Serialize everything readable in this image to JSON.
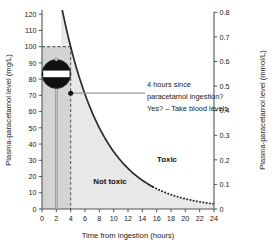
{
  "chart_data": {
    "type": "line",
    "title": "",
    "xlabel": "Time from ingestion (hours)",
    "ylabel": "Plasma-paracetamol level (mg/L)",
    "y2label": "Plasma-paracetamol level (mmol/L)",
    "xlim": [
      0,
      24
    ],
    "ylim": [
      0,
      120
    ],
    "y2lim": [
      0,
      0.8
    ],
    "grid": false,
    "legend": "none",
    "xticks": [
      0,
      2,
      4,
      6,
      8,
      10,
      12,
      14,
      16,
      18,
      20,
      22,
      24
    ],
    "yticks": [
      0,
      10,
      20,
      30,
      40,
      50,
      60,
      70,
      80,
      90,
      100,
      110,
      120
    ],
    "y2ticks": [
      "0",
      "0.1",
      "0.2",
      "0.3",
      "0.4",
      "0.5",
      "0.6",
      "0.7",
      "0.8"
    ],
    "series": [
      {
        "name": "treatment-line",
        "style": "solid-then-dotted",
        "solid_to_x": 15.5,
        "x": [
          1.5,
          2,
          3,
          4,
          5,
          6,
          7,
          8,
          9,
          10,
          11,
          12,
          13,
          14,
          15,
          16,
          17,
          18,
          19,
          20,
          21,
          22,
          23,
          24
        ],
        "y": [
          200,
          170,
          128,
          100,
          80,
          65,
          53,
          43,
          35,
          29,
          24,
          20,
          16.5,
          13.8,
          11.5,
          9.6,
          8.0,
          6.7,
          5.6,
          4.7,
          3.9,
          3.3,
          2.8,
          2.4
        ]
      }
    ],
    "markers": [
      {
        "name": "four-hour-point",
        "x": 4,
        "y": 70,
        "shape": "filled-circle"
      }
    ],
    "reference_lines": [
      {
        "name": "hundred-mg-per-l-dashed",
        "orientation": "horizontal",
        "y": 100,
        "x_from": 0,
        "x_to": 4,
        "style": "dashed"
      },
      {
        "name": "four-hours-dashed",
        "orientation": "vertical",
        "x": 4,
        "y_from": 0,
        "y_to": 100,
        "style": "dashed"
      }
    ],
    "zones": [
      {
        "name": "toxic",
        "label": "Toxic",
        "x": 13.2,
        "y": 46
      },
      {
        "name": "not-toxic",
        "label": "Not toxic",
        "x": 7.4,
        "y": 20
      }
    ],
    "shaded_regions": [
      {
        "name": "pre-four-hour-band",
        "description": "darker grey band from 0 to 4 hours up to 100 mg/L",
        "color": "#d4d4d4"
      },
      {
        "name": "under-curve-band",
        "description": "light grey fill under the treatment line",
        "color": "#e8e8e8"
      }
    ]
  },
  "annotation": {
    "name": "four-hour-annotation",
    "lines": [
      "4 hours since",
      "paracetamol ingestion?",
      "Yes? – Take blood levels"
    ]
  },
  "icon": {
    "name": "no-entry-sign-icon",
    "description": "no entry road sign on a post at 2 hours",
    "x": 2,
    "y_top": 90,
    "colors": {
      "disc": "#111111",
      "bar": "#ffffff",
      "post": "#9a9a9a"
    }
  },
  "colors": {
    "axis": "#555555",
    "curve": "#2b2b2b",
    "dashed": "#6b6b6b",
    "leader": "#9a9a9a",
    "band_dark": "#d4d4d4",
    "band_light": "#e8e8e8",
    "text": "#1a1a1a",
    "background": "#ffffff"
  }
}
